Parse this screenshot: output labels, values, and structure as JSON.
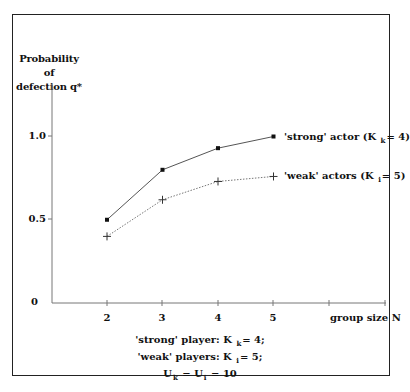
{
  "chart_data": {
    "type": "line",
    "title": "",
    "ylabel": "Probability of defection q*",
    "xlabel": "group size N",
    "x": [
      2,
      3,
      4,
      5
    ],
    "xticks": [
      "2",
      "3",
      "4",
      "5",
      "",
      ""
    ],
    "yticks": [
      "0",
      "0.5",
      "1.0"
    ],
    "ylim": [
      0,
      1.1
    ],
    "xlim": [
      1,
      7
    ],
    "grid": false,
    "legend_position": "right-inline",
    "series": [
      {
        "name": "'strong' actor (K k = 4)",
        "marker": "square",
        "line": "solid",
        "values": [
          0.5,
          0.8,
          0.93,
          1.0
        ]
      },
      {
        "name": "'weak' actors (K i = 5)",
        "marker": "plus",
        "line": "dotted",
        "values": [
          0.4,
          0.62,
          0.73,
          0.76
        ]
      }
    ],
    "annotations": [
      "'strong' player: K k = 4;",
      "'weak' players: K i = 5;",
      "U k = U i = 10"
    ]
  },
  "axis": {
    "ylabel_line1": "Probability of",
    "ylabel_line2": "defection q*",
    "ytick_0": "0",
    "ytick_05": "0.5",
    "ytick_10": "1.0",
    "xtick_2": "2",
    "xtick_3": "3",
    "xtick_4": "4",
    "xtick_5": "5",
    "xlabel": "group size N"
  },
  "legend": {
    "strong_prefix": "'strong' actor (K",
    "strong_sub": "k",
    "strong_suffix": "= 4)",
    "weak_prefix": "'weak' actors (K",
    "weak_sub": "i",
    "weak_suffix": "= 5)"
  },
  "note": {
    "line1_prefix": "'strong' player: K",
    "line1_sub": "k",
    "line1_suffix": "= 4;",
    "line2_prefix": "'weak' players: K",
    "line2_sub": "i",
    "line2_suffix": "= 5;",
    "line3_a": "U",
    "line3_sub_a": "k",
    "line3_mid": "= U",
    "line3_sub_b": "i",
    "line3_suffix": "= 10"
  }
}
